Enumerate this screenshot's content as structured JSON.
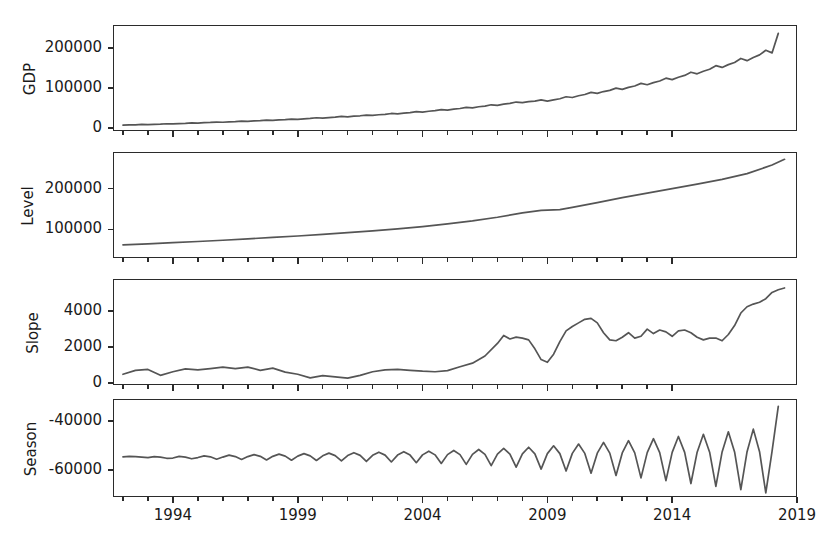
{
  "figure": {
    "background": "#ffffff",
    "line_color": "#555555",
    "axis_color": "#2b2b2b",
    "width": 836,
    "height": 546
  },
  "axes": {
    "x_label": "",
    "x_ticks": [
      "1994",
      "1999",
      "2004",
      "2009",
      "2014",
      "2019"
    ],
    "x_tick_values": [
      1994,
      1999,
      2004,
      2009,
      2014,
      2019
    ],
    "x_range": [
      1991.6,
      2019.0
    ]
  },
  "panels": [
    {
      "name": "gdp",
      "ylabel": "GDP",
      "y_ticks": [
        "0",
        "100000",
        "200000"
      ],
      "y_tick_values": [
        0,
        100000,
        200000
      ],
      "ylim": [
        -8000,
        258000
      ]
    },
    {
      "name": "level",
      "ylabel": "Level",
      "y_ticks": [
        "100000",
        "200000"
      ],
      "y_tick_values": [
        100000,
        200000
      ],
      "ylim": [
        30000,
        290000
      ]
    },
    {
      "name": "slope",
      "ylabel": "Slope",
      "y_ticks": [
        "0",
        "2000",
        "4000"
      ],
      "y_tick_values": [
        0,
        2000,
        4000
      ],
      "ylim": [
        -120,
        5800
      ]
    },
    {
      "name": "season",
      "ylabel": "Season",
      "y_ticks": [
        "-60000",
        "-40000"
      ],
      "y_tick_values": [
        -60000,
        -40000
      ],
      "ylim": [
        -71000,
        -31000
      ]
    }
  ],
  "chart_data": {
    "type": "line",
    "title": "",
    "xlabel": "",
    "layout": "4 stacked panels sharing a common time x-axis",
    "grid": false,
    "legend": false,
    "x_tick_labels": [
      "1994",
      "1999",
      "2004",
      "2009",
      "2014",
      "2019"
    ],
    "x_range": [
      1991.6,
      2019.0
    ],
    "subplots": [
      {
        "name": "gdp",
        "ylabel": "GDP",
        "ylim": [
          -8000,
          258000
        ],
        "y_ticks": [
          0,
          100000,
          200000
        ],
        "x": [
          1992.0,
          1992.25,
          1992.5,
          1992.75,
          1993.0,
          1993.25,
          1993.5,
          1993.75,
          1994.0,
          1994.25,
          1994.5,
          1994.75,
          1995.0,
          1995.25,
          1995.5,
          1995.75,
          1996.0,
          1996.25,
          1996.5,
          1996.75,
          1997.0,
          1997.25,
          1997.5,
          1997.75,
          1998.0,
          1998.25,
          1998.5,
          1998.75,
          1999.0,
          1999.25,
          1999.5,
          1999.75,
          2000.0,
          2000.25,
          2000.5,
          2000.75,
          2001.0,
          2001.25,
          2001.5,
          2001.75,
          2002.0,
          2002.25,
          2002.5,
          2002.75,
          2003.0,
          2003.25,
          2003.5,
          2003.75,
          2004.0,
          2004.25,
          2004.5,
          2004.75,
          2005.0,
          2005.25,
          2005.5,
          2005.75,
          2006.0,
          2006.25,
          2006.5,
          2006.75,
          2007.0,
          2007.25,
          2007.5,
          2007.75,
          2008.0,
          2008.25,
          2008.5,
          2008.75,
          2009.0,
          2009.25,
          2009.5,
          2009.75,
          2010.0,
          2010.25,
          2010.5,
          2010.75,
          2011.0,
          2011.25,
          2011.5,
          2011.75,
          2012.0,
          2012.25,
          2012.5,
          2012.75,
          2013.0,
          2013.25,
          2013.5,
          2013.75,
          2014.0,
          2014.25,
          2014.5,
          2014.75,
          2015.0,
          2015.25,
          2015.5,
          2015.75,
          2016.0,
          2016.25,
          2016.5,
          2016.75,
          2017.0,
          2017.25,
          2017.5,
          2017.75,
          2018.0,
          2018.25
        ],
        "y": [
          6500,
          7200,
          7600,
          8400,
          8000,
          8800,
          9300,
          10200,
          9800,
          10700,
          11200,
          12200,
          11800,
          12800,
          13400,
          14400,
          13900,
          14900,
          15600,
          16800,
          16200,
          17300,
          18000,
          19400,
          18600,
          19800,
          20600,
          22000,
          21200,
          22600,
          23500,
          25200,
          24200,
          25800,
          26800,
          28600,
          27600,
          29200,
          30200,
          32000,
          31000,
          32800,
          33900,
          36000,
          34900,
          36900,
          38200,
          40600,
          39400,
          41600,
          43000,
          45600,
          44400,
          46900,
          48500,
          51300,
          50000,
          52900,
          54600,
          57800,
          56400,
          59400,
          61200,
          64700,
          63000,
          65500,
          67000,
          70000,
          67000,
          70000,
          73000,
          78000,
          76000,
          80500,
          83500,
          89000,
          86500,
          91000,
          94000,
          99500,
          96500,
          101500,
          105000,
          111500,
          108000,
          113500,
          117500,
          124500,
          121000,
          127000,
          131500,
          139500,
          135500,
          142000,
          147000,
          156000,
          151500,
          158500,
          164000,
          174000,
          168500,
          176500,
          183000,
          194500,
          188000,
          237000
        ],
        "description": "Quarterly GDP series rising from about 6,500 in 1992 to about 237,000 at the end of 2018, with a clear seasonal sawtooth whose amplitude grows over time."
      },
      {
        "name": "level",
        "ylabel": "Level",
        "ylim": [
          30000,
          290000
        ],
        "y_ticks": [
          100000,
          200000
        ],
        "x": [
          1992.0,
          1993.0,
          1994.0,
          1995.0,
          1996.0,
          1997.0,
          1998.0,
          1999.0,
          2000.0,
          2001.0,
          2002.0,
          2003.0,
          2004.0,
          2005.0,
          2006.0,
          2007.0,
          2008.0,
          2008.75,
          2009.5,
          2010.0,
          2011.0,
          2012.0,
          2013.0,
          2014.0,
          2015.0,
          2016.0,
          2017.0,
          2018.0,
          2018.5
        ],
        "y": [
          62000,
          64500,
          67500,
          70500,
          73500,
          77000,
          80500,
          84000,
          88000,
          92000,
          96500,
          101500,
          107000,
          113500,
          121000,
          130000,
          140500,
          147000,
          148500,
          154000,
          166000,
          178000,
          189000,
          200000,
          211000,
          223000,
          237000,
          258000,
          272000
        ],
        "description": "Smooth monotonically increasing local-level (trend) component, from roughly 62,000 in 1992 to about 272,000 in 2018, with a brief flattening around 2009."
      },
      {
        "name": "slope",
        "ylabel": "Slope",
        "ylim": [
          -120,
          5800
        ],
        "y_ticks": [
          0,
          2000,
          4000
        ],
        "x": [
          1992.0,
          1992.5,
          1993.0,
          1993.5,
          1994.0,
          1994.5,
          1995.0,
          1995.5,
          1996.0,
          1996.5,
          1997.0,
          1997.5,
          1998.0,
          1998.5,
          1999.0,
          1999.5,
          2000.0,
          2000.5,
          2001.0,
          2001.5,
          2002.0,
          2002.5,
          2003.0,
          2003.5,
          2004.0,
          2004.5,
          2005.0,
          2005.5,
          2006.0,
          2006.5,
          2007.0,
          2007.25,
          2007.5,
          2007.75,
          2008.0,
          2008.25,
          2008.5,
          2008.75,
          2009.0,
          2009.25,
          2009.5,
          2009.75,
          2010.0,
          2010.25,
          2010.5,
          2010.75,
          2011.0,
          2011.25,
          2011.5,
          2011.75,
          2012.0,
          2012.25,
          2012.5,
          2012.75,
          2013.0,
          2013.25,
          2013.5,
          2013.75,
          2014.0,
          2014.25,
          2014.5,
          2014.75,
          2015.0,
          2015.25,
          2015.5,
          2015.75,
          2016.0,
          2016.25,
          2016.5,
          2016.75,
          2017.0,
          2017.25,
          2017.5,
          2017.75,
          2018.0,
          2018.25,
          2018.5
        ],
        "y": [
          480,
          700,
          750,
          420,
          620,
          780,
          730,
          800,
          880,
          790,
          880,
          700,
          820,
          600,
          480,
          280,
          400,
          330,
          260,
          420,
          620,
          720,
          750,
          700,
          650,
          620,
          680,
          900,
          1100,
          1500,
          2200,
          2650,
          2450,
          2550,
          2500,
          2400,
          1900,
          1300,
          1150,
          1600,
          2300,
          2900,
          3150,
          3350,
          3550,
          3600,
          3350,
          2800,
          2400,
          2350,
          2550,
          2800,
          2500,
          2600,
          3000,
          2750,
          2950,
          2850,
          2600,
          2900,
          2950,
          2800,
          2550,
          2400,
          2500,
          2500,
          2350,
          2700,
          3200,
          3900,
          4250,
          4400,
          4500,
          4700,
          5050,
          5200,
          5300
        ],
        "description": "Local linear trend slope component. Low (400-900) through the 1990s, rising after 2004 to a peak near 2650 in 2007, sharply dipping to about 1150 in early 2009, recovering to a peak near 3600 around 2010-2011, oscillating between 2300-3000 through 2015, then climbing to about 5300 at the end."
      },
      {
        "name": "season",
        "ylabel": "Season",
        "ylim": [
          -71000,
          -31000
        ],
        "y_ticks": [
          -60000,
          -40000
        ],
        "description": "Quarterly seasonal component oscillating about -54,000 with a sawtooth shape whose amplitude grows steadily from roughly ±1,500 in 1992 to roughly ±11,000 by 2018; the final point rises sharply to about -34,000.",
        "x": [
          1992.0,
          1992.25,
          1992.5,
          1992.75,
          1993.0,
          1993.25,
          1993.5,
          1993.75,
          1994.0,
          1994.25,
          1994.5,
          1994.75,
          1995.0,
          1995.25,
          1995.5,
          1995.75,
          1996.0,
          1996.25,
          1996.5,
          1996.75,
          1997.0,
          1997.25,
          1997.5,
          1997.75,
          1998.0,
          1998.25,
          1998.5,
          1998.75,
          1999.0,
          1999.25,
          1999.5,
          1999.75,
          2000.0,
          2000.25,
          2000.5,
          2000.75,
          2001.0,
          2001.25,
          2001.5,
          2001.75,
          2002.0,
          2002.25,
          2002.5,
          2002.75,
          2003.0,
          2003.25,
          2003.5,
          2003.75,
          2004.0,
          2004.25,
          2004.5,
          2004.75,
          2005.0,
          2005.25,
          2005.5,
          2005.75,
          2006.0,
          2006.25,
          2006.5,
          2006.75,
          2007.0,
          2007.25,
          2007.5,
          2007.75,
          2008.0,
          2008.25,
          2008.5,
          2008.75,
          2009.0,
          2009.25,
          2009.5,
          2009.75,
          2010.0,
          2010.25,
          2010.5,
          2010.75,
          2011.0,
          2011.25,
          2011.5,
          2011.75,
          2012.0,
          2012.25,
          2012.5,
          2012.75,
          2013.0,
          2013.25,
          2013.5,
          2013.75,
          2014.0,
          2014.25,
          2014.5,
          2014.75,
          2015.0,
          2015.25,
          2015.5,
          2015.75,
          2016.0,
          2016.25,
          2016.5,
          2016.75,
          2017.0,
          2017.25,
          2017.5,
          2017.75,
          2018.0,
          2018.25
        ],
        "y": [
          -54600,
          -54400,
          -54500,
          -54700,
          -54900,
          -54500,
          -54700,
          -55200,
          -55100,
          -54400,
          -54700,
          -55400,
          -54900,
          -54200,
          -54600,
          -55600,
          -54700,
          -53900,
          -54500,
          -55700,
          -54500,
          -53700,
          -54400,
          -55900,
          -54400,
          -53500,
          -54300,
          -56000,
          -54300,
          -53300,
          -54200,
          -56100,
          -54200,
          -53100,
          -54100,
          -56300,
          -54100,
          -52900,
          -54000,
          -56500,
          -54000,
          -52700,
          -53900,
          -56700,
          -53900,
          -52500,
          -53900,
          -57000,
          -53800,
          -52300,
          -53800,
          -57300,
          -53700,
          -52000,
          -53700,
          -57700,
          -53600,
          -51600,
          -53600,
          -58200,
          -53500,
          -51200,
          -53500,
          -58800,
          -53400,
          -50700,
          -53400,
          -59600,
          -53300,
          -50100,
          -53300,
          -60400,
          -53200,
          -49400,
          -53200,
          -61300,
          -53100,
          -48700,
          -53100,
          -62200,
          -53000,
          -48000,
          -53000,
          -63200,
          -52900,
          -47200,
          -52900,
          -64300,
          -52800,
          -46300,
          -52800,
          -65500,
          -52700,
          -45400,
          -52700,
          -66700,
          -52600,
          -44400,
          -52600,
          -68000,
          -52500,
          -43300,
          -52500,
          -69300,
          -52400,
          -34000
        ]
      }
    ]
  }
}
